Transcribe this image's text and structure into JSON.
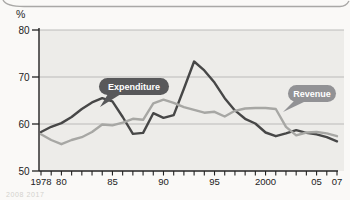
{
  "unit_label": "%",
  "footnote": "2008  2017",
  "colors": {
    "page_bg": "#faf9f7",
    "plot_bg": "#edece9",
    "gridline": "#b6b5b3",
    "axis": "#222222",
    "card_edge": "#a9a8a6",
    "pill_text": "#ffffff"
  },
  "chart_data": {
    "type": "line",
    "title": "",
    "unit_label": "%",
    "xlabel": "",
    "ylabel": "%",
    "ylim": [
      50,
      80
    ],
    "yticks": [
      50,
      60,
      70,
      80
    ],
    "grid": "horizontal",
    "legend_position": "inline-callouts",
    "x": [
      1978,
      1979,
      1980,
      1981,
      1982,
      1983,
      1984,
      1985,
      1986,
      1987,
      1988,
      1989,
      1990,
      1991,
      1992,
      1993,
      1994,
      1995,
      1996,
      1997,
      1998,
      1999,
      2000,
      2001,
      2002,
      2003,
      2004,
      2005,
      2006,
      2007
    ],
    "x_tick_labels": [
      {
        "year": 1978,
        "label": "1978"
      },
      {
        "year": 1980,
        "label": "80"
      },
      {
        "year": 1985,
        "label": "85"
      },
      {
        "year": 1990,
        "label": "90"
      },
      {
        "year": 1995,
        "label": "95"
      },
      {
        "year": 2000,
        "label": "2000"
      },
      {
        "year": 2005,
        "label": "05"
      },
      {
        "year": 2007,
        "label": "07"
      }
    ],
    "series": [
      {
        "name": "Expenditure",
        "color": "#474747",
        "label_bg": "#58585a",
        "values": [
          58.3,
          59.4,
          60.2,
          61.5,
          63.2,
          64.6,
          65.5,
          64.8,
          61.5,
          57.9,
          58.1,
          62.3,
          61.3,
          61.9,
          67.5,
          73.3,
          71.4,
          68.8,
          65.5,
          62.9,
          61.1,
          60.1,
          58.2,
          57.4,
          58.0,
          58.7,
          58.1,
          57.8,
          57.2,
          56.3
        ]
      },
      {
        "name": "Revenue",
        "color": "#a7a7a4",
        "label_bg": "#929295",
        "values": [
          57.8,
          56.6,
          55.7,
          56.6,
          57.2,
          58.3,
          59.9,
          59.7,
          60.3,
          61.1,
          60.9,
          64.4,
          65.2,
          64.5,
          63.6,
          63.0,
          62.4,
          62.6,
          61.6,
          62.8,
          63.3,
          63.4,
          63.4,
          63.2,
          59.4,
          57.6,
          58.2,
          58.3,
          58.0,
          57.4
        ]
      }
    ]
  }
}
